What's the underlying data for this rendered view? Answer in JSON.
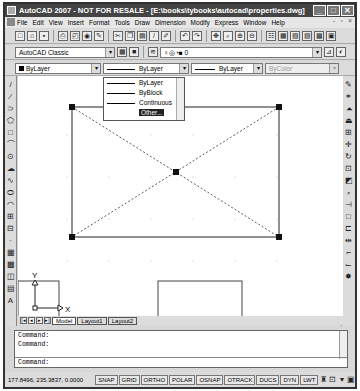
{
  "title": "AutoCAD 2007 - NOT FOR RESALE - [E:\\books\\tybooks\\autocad\\properties.dwg]",
  "window_buttons": [
    "_",
    "□",
    "✕"
  ],
  "menu": [
    "File",
    "Edit",
    "View",
    "Insert",
    "Format",
    "Tools",
    "Draw",
    "Dimension",
    "Modify",
    "Express",
    "Window",
    "Help"
  ],
  "workspace": "AutoCAD Classic",
  "layer": "0",
  "properties": {
    "color": "ByLayer",
    "linetype": "ByLayer",
    "lineweight": "ByLayer",
    "plotstyle": "ByColor"
  },
  "linetype_dropdown": [
    {
      "label": "ByLayer"
    },
    {
      "label": "ByBlock"
    },
    {
      "label": "Continuous"
    },
    {
      "label": "Other..."
    }
  ],
  "ucs": {
    "x": "X",
    "y": "Y"
  },
  "tabs": [
    "Model",
    "Layout1",
    "Layout2"
  ],
  "command": {
    "lines": [
      "Command:",
      "Command:"
    ],
    "prompt": "Command:"
  },
  "status": {
    "coords": "177.8496, 235.3837, 0.0000",
    "buttons": [
      "SNAP",
      "GRID",
      "ORTHO",
      "POLAR",
      "OSNAP",
      "OTRACK",
      "DUCS",
      "DYN",
      "LWT"
    ]
  }
}
